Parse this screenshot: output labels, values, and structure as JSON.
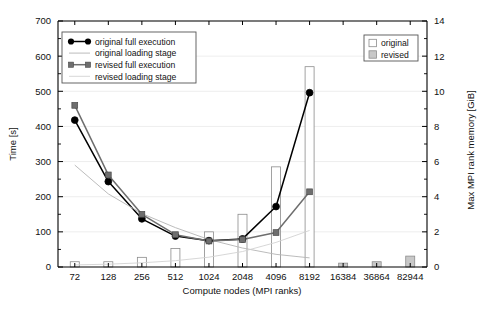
{
  "chart_data": {
    "type": "bar",
    "title": "",
    "xlabel": "Compute nodes (MPI ranks)",
    "ylabel": "Time [s]",
    "y2label": "Max MPI rank memory [GiB]",
    "categories": [
      "72",
      "128",
      "256",
      "512",
      "1024",
      "2048",
      "4096",
      "8192",
      "16384",
      "36864",
      "82944"
    ],
    "ylim": [
      0,
      700
    ],
    "yticks": [
      0,
      100,
      200,
      300,
      400,
      500,
      600,
      700
    ],
    "y2lim": [
      0,
      14
    ],
    "y2ticks": [
      0,
      2,
      4,
      6,
      8,
      10,
      12,
      14
    ],
    "grid": true,
    "legend_position": "upper-left and upper-right",
    "series": [
      {
        "name": "original full execution",
        "type": "line",
        "marker": "circle",
        "color": "#000000",
        "axis": "left",
        "values": [
          418,
          243,
          137,
          88,
          75,
          80,
          172,
          496,
          null,
          null,
          null
        ]
      },
      {
        "name": "original loading stage",
        "type": "line",
        "marker": "none",
        "color": "#b4b4b4",
        "axis": "left",
        "values": [
          290,
          208,
          152,
          112,
          78,
          54,
          36,
          26,
          null,
          null,
          null
        ]
      },
      {
        "name": "revised full execution",
        "type": "line",
        "marker": "square",
        "color": "#6e6e6e",
        "axis": "left",
        "values": [
          460,
          262,
          150,
          92,
          74,
          78,
          98,
          214,
          null,
          null,
          null
        ]
      },
      {
        "name": "revised loading stage",
        "type": "line",
        "marker": "none",
        "color": "#d2d2d2",
        "axis": "left",
        "values": [
          6,
          8,
          12,
          18,
          28,
          44,
          70,
          104,
          null,
          null,
          null
        ]
      }
    ],
    "bar_series": [
      {
        "name": "original",
        "fill": "#ffffff",
        "edge": "#8c8c8c",
        "axis": "right",
        "values": [
          0.3,
          0.3,
          0.55,
          1.05,
          2.0,
          3.0,
          5.7,
          11.4,
          null,
          null,
          null
        ]
      },
      {
        "name": "revised",
        "fill": "#c8c8c8",
        "edge": "#8c8c8c",
        "axis": "right",
        "values": [
          null,
          null,
          null,
          null,
          null,
          null,
          null,
          null,
          0.22,
          0.3,
          0.62
        ]
      }
    ],
    "legend_lines": [
      "original full execution",
      "original loading stage",
      "revised full execution",
      "revised loading stage"
    ],
    "legend_bars": [
      "original",
      "revised"
    ],
    "colors": {
      "original_line": "#000000",
      "revised_line": "#6e6e6e",
      "original_loading": "#b4b4b4",
      "revised_loading": "#d2d2d2",
      "bar_original_fill": "#ffffff",
      "bar_revised_fill": "#c8c8c8",
      "axis": "#000000",
      "grid": "#e8e8e8"
    }
  }
}
